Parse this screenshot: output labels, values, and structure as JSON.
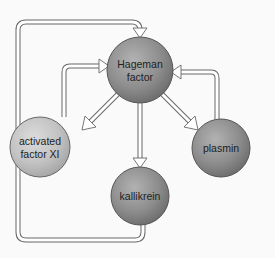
{
  "diagram": {
    "nodes": [
      {
        "id": "hageman",
        "label_line1": "Hageman",
        "label_line2": "factor",
        "color": "#8a8a8a"
      },
      {
        "id": "factor_xi",
        "label_line1": "activated",
        "label_line2": "factor XI",
        "color": "#bdbdbd"
      },
      {
        "id": "plasmin",
        "label_line1": "plasmin",
        "color": "#8c8c8c"
      },
      {
        "id": "kallikrein",
        "label_line1": "kallikrein",
        "color": "#8a8a8a"
      }
    ],
    "edges": [
      {
        "from": "hageman",
        "to": "factor_xi"
      },
      {
        "from": "hageman",
        "to": "kallikrein"
      },
      {
        "from": "hageman",
        "to": "plasmin"
      },
      {
        "from": "factor_xi",
        "to": "hageman"
      },
      {
        "from": "plasmin",
        "to": "hageman"
      },
      {
        "from": "kallikrein",
        "to": "hageman"
      }
    ],
    "colors": {
      "background": "#fafafa",
      "pipe_outline": "#666666",
      "pipe_fill": "#ffffff"
    }
  }
}
